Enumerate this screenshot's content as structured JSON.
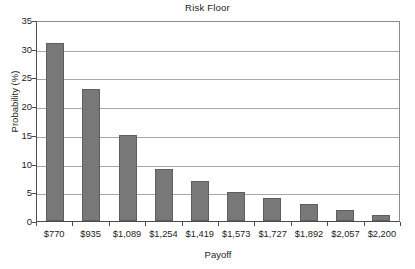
{
  "chart_data": {
    "type": "bar",
    "title": "Risk Floor",
    "xlabel": "Payoff",
    "ylabel": "Probability (%)",
    "categories": [
      "$770",
      "$935",
      "$1,089",
      "$1,254",
      "$1,419",
      "$1,573",
      "$1,727",
      "$1,892",
      "$2,057",
      "$2,200"
    ],
    "values": [
      31,
      23,
      15,
      9,
      7,
      5,
      4,
      3,
      2,
      1
    ],
    "ylim": [
      0,
      35
    ],
    "yticks": [
      0,
      5,
      10,
      15,
      20,
      25,
      30,
      35
    ],
    "ytick_labels": [
      "0",
      "5",
      "10",
      "15",
      "20",
      "25",
      "30",
      "35"
    ],
    "grid": true,
    "grid_axis": "y",
    "legend": false,
    "bar_color": "#787878",
    "bar_edge_color": "#5e5e5e",
    "gridline_color": "#a8a8a8",
    "axis_color": "#4d4d4d",
    "text_color": "#1c1c1c",
    "background": "#ffffff"
  }
}
